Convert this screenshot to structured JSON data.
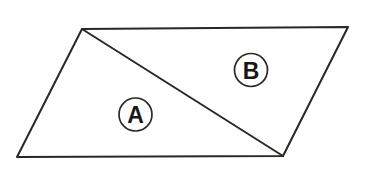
{
  "figure": {
    "background_color": "#ffffff",
    "stroke_color": "#2b2724",
    "fill_color": "#ffffff",
    "stroke_width": 2,
    "canvas": {
      "width": 368,
      "height": 172
    },
    "outline": {
      "name": "parallelogram",
      "points": "82,29 348,27 283,156 17,157",
      "vertices": [
        {
          "name": "top-left",
          "x": 82,
          "y": 29
        },
        {
          "name": "top-right",
          "x": 348,
          "y": 27
        },
        {
          "name": "bottom-right",
          "x": 283,
          "y": 156
        },
        {
          "name": "bottom-left",
          "x": 17,
          "y": 157
        }
      ]
    },
    "diagonal": {
      "name": "diagonal-top-left-to-bottom-right",
      "x1": 82,
      "y1": 29,
      "x2": 283,
      "y2": 156
    },
    "regions": [
      {
        "id": "A",
        "label": "A",
        "description": "lower-left triangle",
        "points": "82,29 283,156 17,157",
        "marker": {
          "cx": 135.5,
          "cy": 114.5,
          "r": 16.5
        }
      },
      {
        "id": "B",
        "label": "B",
        "description": "upper-right triangle",
        "points": "82,29 348,27 283,156",
        "marker": {
          "cx": 251,
          "cy": 70,
          "r": 16.5
        }
      }
    ]
  }
}
